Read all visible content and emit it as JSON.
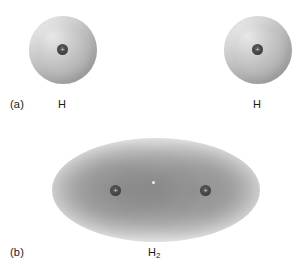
{
  "figure": {
    "background_color": "#ffffff"
  },
  "panels": [
    {
      "id": "a",
      "label": "(a)",
      "species_left_label": "H",
      "species_right_label": "H"
    },
    {
      "id": "b",
      "label": "(b)",
      "species_label_base": "H",
      "species_label_sub": "2"
    }
  ],
  "nucleus": {
    "charge_symbol": "+",
    "color": "#3f3f3f"
  },
  "colors": {
    "sphere_highlight": "#e8e8e8",
    "sphere_midtone": "#bdbdbd",
    "sphere_shadow": "#9a9a9a",
    "cloud_dense": "#8a8a8a",
    "cloud_outer": "#f2f2f2",
    "text": "#1a1a1a"
  }
}
